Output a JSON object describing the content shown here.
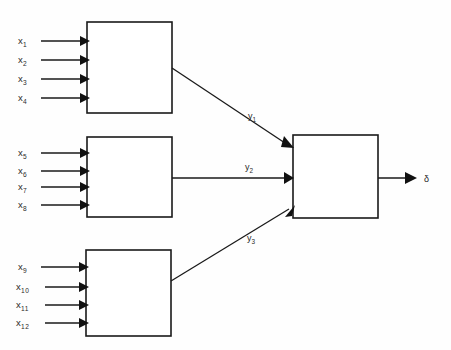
{
  "diagram": {
    "background_color": "#fefefe",
    "stroke_color": "#1a1a1a",
    "blocks": [
      {
        "id": "block-1",
        "x": 87,
        "y": 22,
        "w": 85,
        "h": 91,
        "label": "",
        "inputs": [
          {
            "base": "x",
            "sub": "1",
            "y": 41
          },
          {
            "base": "x",
            "sub": "2",
            "y": 60
          },
          {
            "base": "x",
            "sub": "3",
            "y": 79
          },
          {
            "base": "x",
            "sub": "4",
            "y": 98
          }
        ],
        "output": {
          "base": "y",
          "sub": "1"
        }
      },
      {
        "id": "block-2",
        "x": 87,
        "y": 137,
        "w": 85,
        "h": 80,
        "label": "",
        "inputs": [
          {
            "base": "x",
            "sub": "5",
            "y": 153
          },
          {
            "base": "x",
            "sub": "6",
            "y": 171
          },
          {
            "base": "x",
            "sub": "7",
            "y": 187
          },
          {
            "base": "x",
            "sub": "8",
            "y": 205
          }
        ],
        "output": {
          "base": "y",
          "sub": "2"
        }
      },
      {
        "id": "block-3",
        "x": 86,
        "y": 250,
        "w": 85,
        "h": 86,
        "label": "",
        "inputs": [
          {
            "base": "x",
            "sub": "9",
            "y": 267
          },
          {
            "base": "x",
            "sub": "10",
            "y": 287
          },
          {
            "base": "x",
            "sub": "11",
            "y": 305
          },
          {
            "base": "x",
            "sub": "12",
            "y": 323
          }
        ],
        "output": {
          "base": "y",
          "sub": "3"
        }
      }
    ],
    "combiner": {
      "id": "combiner-block",
      "x": 293,
      "y": 135,
      "w": 85,
      "h": 83,
      "label": ""
    },
    "output": {
      "symbol": "δ",
      "name": "delta"
    },
    "signals": [
      {
        "base": "y",
        "sub": "1",
        "label_x": 250,
        "label_y": 119
      },
      {
        "base": "y",
        "sub": "2",
        "label_x": 247,
        "label_y": 170
      },
      {
        "base": "y",
        "sub": "3",
        "label_x": 249,
        "label_y": 241
      }
    ]
  }
}
